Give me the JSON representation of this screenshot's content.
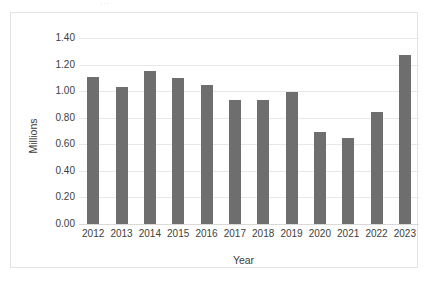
{
  "chart_data": {
    "type": "bar",
    "title": "",
    "subtitle": "",
    "xlabel": "Year",
    "ylabel": "Millions",
    "categories": [
      "2012",
      "2013",
      "2014",
      "2015",
      "2016",
      "2017",
      "2018",
      "2019",
      "2020",
      "2021",
      "2022",
      "2023"
    ],
    "values": [
      1.11,
      1.03,
      1.15,
      1.1,
      1.05,
      0.93,
      0.93,
      0.99,
      0.69,
      0.65,
      0.84,
      1.27
    ],
    "series": [
      {
        "name": "Millions",
        "values": [
          1.11,
          1.03,
          1.15,
          1.1,
          1.05,
          0.93,
          0.93,
          0.99,
          0.69,
          0.65,
          0.84,
          1.27
        ]
      }
    ],
    "ylim": [
      0.0,
      1.4
    ],
    "ytick_values": [
      0.0,
      0.2,
      0.4,
      0.6,
      0.8,
      1.0,
      1.2,
      1.4
    ],
    "ytick_labels": [
      "0.00",
      "0.20",
      "0.40",
      "0.60",
      "0.80",
      "1.00",
      "1.20",
      "1.40"
    ],
    "grid": "horizontal",
    "legend": "none",
    "bar_color": "#6e6e6e",
    "gridline_color": "#e8e8e8",
    "border_color": "#e3e3e3",
    "background_color": "#ffffff",
    "annotations": []
  },
  "artifact": {
    "text": "···"
  }
}
